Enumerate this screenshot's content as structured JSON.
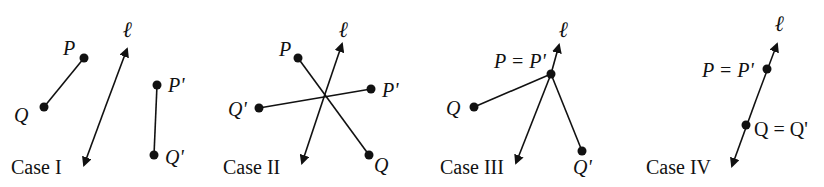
{
  "figure": {
    "cases": [
      {
        "caption": "Case I",
        "line_label": "ℓ",
        "points": {
          "P": "P",
          "Q": "Q",
          "P_prime": "P'",
          "Q_prime": "Q'"
        }
      },
      {
        "caption": "Case II",
        "line_label": "ℓ",
        "points": {
          "P": "P",
          "Q": "Q",
          "P_prime": "P'",
          "Q_prime": "Q'"
        }
      },
      {
        "caption": "Case III",
        "line_label": "ℓ",
        "points": {
          "P_eq": "P = P'",
          "Q": "Q",
          "Q_prime": "Q'"
        }
      },
      {
        "caption": "Case IV",
        "line_label": "ℓ",
        "points": {
          "P_eq": "P = P'",
          "Q_eq": "Q = Q'"
        }
      }
    ]
  }
}
